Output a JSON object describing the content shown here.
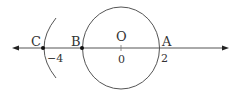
{
  "diagram": {
    "type": "number-line-with-circle",
    "colors": {
      "stroke": "#555555",
      "text": "#333333",
      "point": "#111111"
    },
    "number_line": {
      "y": 48,
      "x_start": 12,
      "x_end": 228,
      "arrows": "both"
    },
    "circle": {
      "center_label": "O",
      "center_value": "0",
      "cx": 121,
      "cy": 48,
      "r": 39
    },
    "arc": {
      "through_point": "C"
    },
    "points": [
      {
        "label": "C",
        "value": "−4",
        "x": 43
      },
      {
        "label": "B",
        "value": "",
        "x": 82
      },
      {
        "label": "A",
        "value": "2",
        "x": 159
      }
    ]
  }
}
